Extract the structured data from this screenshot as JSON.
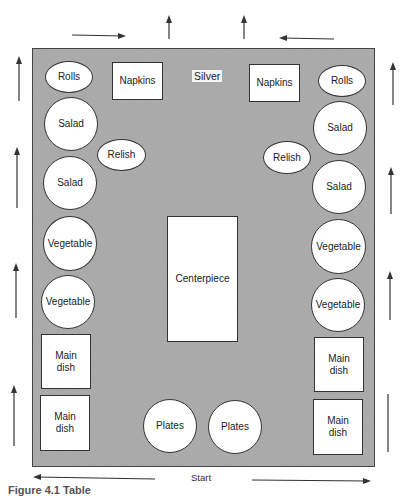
{
  "diagram": {
    "table": {
      "label": "Table",
      "color": "#a9a9a9"
    },
    "items": {
      "silver": "Silver",
      "napkins_left": "Napkins",
      "napkins_right": "Napkins",
      "rolls_left": "Rolls",
      "rolls_right": "Rolls",
      "salad_left_1": "Salad",
      "salad_left_2": "Salad",
      "salad_right_1": "Salad",
      "salad_right_2": "Salad",
      "relish_left": "Relish",
      "relish_right": "Relish",
      "vegetable_left_1": "Vegetable",
      "vegetable_left_2": "Vegetable",
      "vegetable_right_1": "Vegetable",
      "vegetable_right_2": "Vegetable",
      "centerpiece": "Centerpiece",
      "main_dish_left_1_line1": "Main",
      "main_dish_left_1_line2": "dish",
      "main_dish_left_2_line1": "Main",
      "main_dish_left_2_line2": "dish",
      "main_dish_right_1_line1": "Main",
      "main_dish_right_1_line2": "dish",
      "main_dish_right_2_line1": "Main",
      "main_dish_right_2_line2": "dish",
      "plates_left": "Plates",
      "plates_right": "Plates"
    },
    "flow": {
      "start_label": "Start",
      "directions": [
        "bottom: outward left and right from Start",
        "sides: upward",
        "top: inward toward center, then up"
      ]
    },
    "caption": "Figure 4.1  Table"
  }
}
